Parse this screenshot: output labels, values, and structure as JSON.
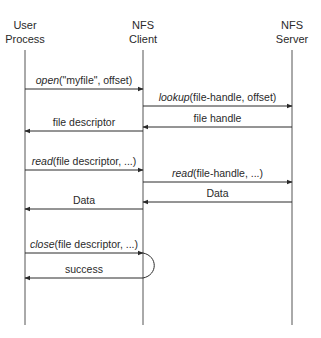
{
  "diagram": {
    "type": "sequence",
    "actors": [
      {
        "id": "user",
        "line1": "User",
        "line2": "Process",
        "x": 25
      },
      {
        "id": "client",
        "line1": "NFS",
        "line2": "Client",
        "x": 143
      },
      {
        "id": "server",
        "line1": "NFS",
        "line2": "Server",
        "x": 292
      }
    ],
    "messages": [
      {
        "from": "user",
        "to": "client",
        "y": 89,
        "fn": "open",
        "args": "(\"myfile\", offset)"
      },
      {
        "from": "client",
        "to": "server",
        "y": 106,
        "fn": "lookup",
        "args": "(file-handle, offset)"
      },
      {
        "from": "server",
        "to": "client",
        "y": 127,
        "fn": "",
        "args": "file handle"
      },
      {
        "from": "client",
        "to": "user",
        "y": 131,
        "fn": "",
        "args": "file descriptor"
      },
      {
        "from": "user",
        "to": "client",
        "y": 170,
        "fn": "read",
        "args": "(file descriptor, ...)"
      },
      {
        "from": "client",
        "to": "server",
        "y": 182,
        "fn": "read",
        "args": "(file-handle, ...)"
      },
      {
        "from": "server",
        "to": "client",
        "y": 202,
        "fn": "",
        "args": "Data"
      },
      {
        "from": "client",
        "to": "user",
        "y": 209,
        "fn": "",
        "args": "Data"
      },
      {
        "from": "user",
        "to": "client",
        "y": 253,
        "fn": "close",
        "args": "(file descriptor, ...)"
      },
      {
        "from": "client",
        "to": "user",
        "y": 278,
        "fn": "",
        "args": "success"
      }
    ]
  }
}
